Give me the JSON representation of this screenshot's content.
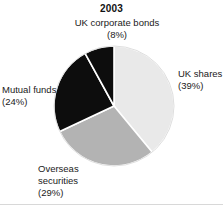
{
  "chart_data": {
    "type": "pie",
    "title": "2003",
    "xlabel": "",
    "ylabel": "",
    "grid": false,
    "legend_position": "callout-labels",
    "start_angle_deg": 0,
    "direction": "clockwise",
    "categories": [
      "UK shares",
      "Overseas securities",
      "Mutual funds",
      "UK corporate bonds"
    ],
    "values": [
      39,
      29,
      24,
      8
    ],
    "value_unit": "percent",
    "slices": [
      {
        "name": "UK shares",
        "value": 39,
        "label_text": "UK shares",
        "value_text": "(39%)",
        "color": "#e9e9e9",
        "start_deg": 0,
        "end_deg": 140.4
      },
      {
        "name": "Overseas securities",
        "value": 29,
        "label_text": "Overseas\nsecurities",
        "value_text": "(29%)",
        "color": "#b3b3b3",
        "start_deg": 140.4,
        "end_deg": 244.8
      },
      {
        "name": "Mutual funds",
        "value": 24,
        "label_text": "Mutual funds",
        "value_text": "(24%)",
        "color": "#0d0d0d",
        "start_deg": 244.8,
        "end_deg": 331.2
      },
      {
        "name": "UK corporate bonds",
        "value": 8,
        "label_text": "UK corporate bonds",
        "value_text": "(8%)",
        "color": "#0d0d0d",
        "start_deg": 331.2,
        "end_deg": 360
      }
    ],
    "slice_separator_color": "#ffffff"
  },
  "title": {
    "text": "2003"
  },
  "labels": {
    "uk_corporate_bonds": "UK corporate bonds\n(8%)",
    "uk_shares": "UK shares\n(39%)",
    "mutual_funds": "Mutual funds\n(24%)",
    "overseas_securities": "Overseas\nsecurities\n(29%)"
  },
  "geometry": {
    "center_x": 114,
    "center_y": 106,
    "radius": 60
  }
}
